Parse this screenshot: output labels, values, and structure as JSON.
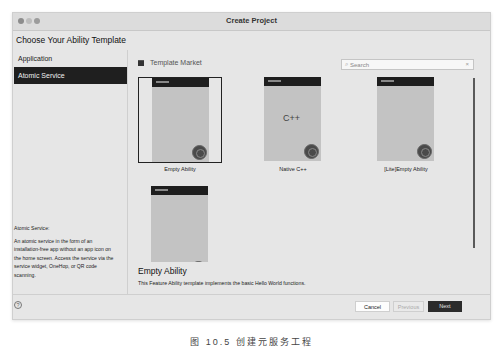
{
  "window": {
    "title": "Create Project"
  },
  "heading": "Choose Your Ability Template",
  "sidebar": {
    "items": [
      {
        "label": "Application",
        "active": false
      },
      {
        "label": "Atomic Service",
        "active": true
      }
    ],
    "info": {
      "title": "Atomic Service:",
      "description": "An atomic service in the form of an installation-free app without an app icon on the home screen. Access the service via the service widget, OneHop, or QR code scanning."
    }
  },
  "main": {
    "market_label": "Template Market",
    "market_icon": "store-icon",
    "search": {
      "placeholder": "Search",
      "value": "",
      "search_icon": "magnifier-icon",
      "clear_icon": "close-icon",
      "search_glyph": "⌕",
      "clear_glyph": "×"
    },
    "templates": [
      {
        "label": "Empty Ability",
        "selected": true,
        "glyph": ""
      },
      {
        "label": "Native C++",
        "selected": false,
        "glyph": "C++"
      },
      {
        "label": "[Lite]Empty Ability",
        "selected": false,
        "glyph": ""
      },
      {
        "label": "",
        "selected": false,
        "glyph": ""
      }
    ],
    "detail": {
      "title": "Empty Ability",
      "description": "This Feature Ability template implements the basic Hello World functions."
    }
  },
  "footer": {
    "help_glyph": "?",
    "cancel_label": "Cancel",
    "previous_label": "Previous",
    "next_label": "Next"
  },
  "caption": "图 10.5   创建元服务工程"
}
